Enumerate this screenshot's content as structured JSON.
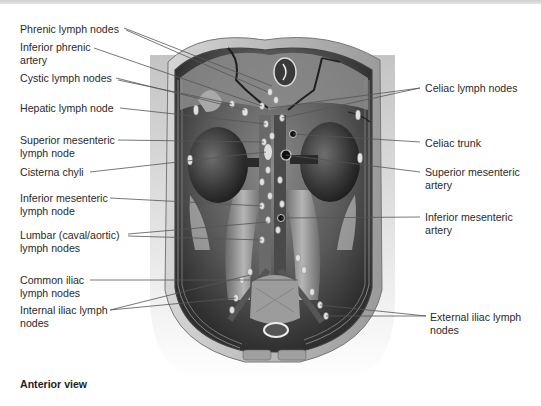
{
  "figure": {
    "caption": "Anterior view",
    "left_labels": [
      {
        "id": "phrenic",
        "text": "Phrenic lymph nodes"
      },
      {
        "id": "inferior-phrenic",
        "text": "Inferior phrenic\nartery"
      },
      {
        "id": "cystic",
        "text": "Cystic lymph nodes"
      },
      {
        "id": "hepatic",
        "text": "Hepatic lymph node"
      },
      {
        "id": "superior-mesenteric-node",
        "text": "Superior mesenteric\nlymph node"
      },
      {
        "id": "cisterna-chyli",
        "text": "Cisterna chyli"
      },
      {
        "id": "inferior-mesenteric-node",
        "text": "Inferior mesenteric\nlymph node"
      },
      {
        "id": "lumbar",
        "text": "Lumbar (caval/aortic)\nlymph nodes"
      },
      {
        "id": "common-iliac",
        "text": "Common iliac\nlymph nodes"
      },
      {
        "id": "internal-iliac",
        "text": "Internal iliac lymph\nnodes"
      }
    ],
    "right_labels": [
      {
        "id": "celiac-nodes",
        "text": "Celiac lymph nodes"
      },
      {
        "id": "celiac-trunk",
        "text": "Celiac trunk"
      },
      {
        "id": "superior-mesenteric-artery",
        "text": "Superior mesenteric\nartery"
      },
      {
        "id": "inferior-mesenteric-artery",
        "text": "Inferior mesenteric\nartery"
      },
      {
        "id": "external-iliac",
        "text": "External iliac lymph\nnodes"
      }
    ],
    "colors": {
      "label_text": "#2a2a2a",
      "leader_line": "#555555",
      "tissue_dark": "#2b2b2b",
      "tissue_mid": "#7a7a7a",
      "tissue_light": "#bdbdbd",
      "node": "#e2e2e2"
    }
  }
}
